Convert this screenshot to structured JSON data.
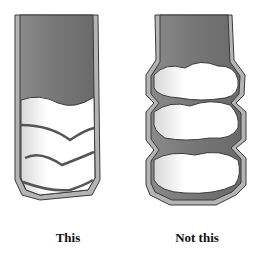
{
  "figure": {
    "left_panel": {
      "caption": "This",
      "description": "tube with smooth, evenly layered filling"
    },
    "right_panel": {
      "caption": "Not this",
      "description": "tube with lumpy, bulging filling"
    }
  },
  "colors": {
    "tube_fill": "#7a7a7a",
    "tube_wall": "#b4b4b4",
    "outline": "#3a3a3a",
    "filling": "#ffffff"
  }
}
